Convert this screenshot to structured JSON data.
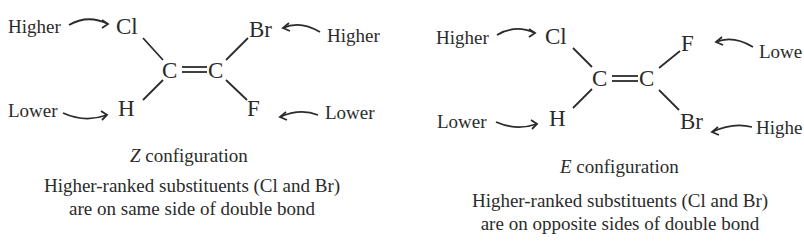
{
  "z_panel": {
    "labels": {
      "cl_rank": "Higher",
      "h_rank": "Lower",
      "br_rank": "Higher",
      "f_rank": "Lower"
    },
    "atoms": {
      "top_left": "Cl",
      "bottom_left": "H",
      "top_right": "Br",
      "bottom_right": "F",
      "carbon_left": "C",
      "carbon_right": "C"
    },
    "caption_italic": "Z",
    "caption_rest": " configuration",
    "description_line1": "Higher-ranked substituents (Cl and Br)",
    "description_line2": "are on same side of double bond"
  },
  "e_panel": {
    "labels": {
      "cl_rank": "Higher",
      "h_rank": "Lower",
      "f_rank": "Lowe",
      "br_rank": "Highe"
    },
    "atoms": {
      "top_left": "Cl",
      "bottom_left": "H",
      "top_right": "F",
      "bottom_right": "Br",
      "carbon_left": "C",
      "carbon_right": "C"
    },
    "caption_italic": "E",
    "caption_rest": " configuration",
    "description_line1": "Higher-ranked substituents (Cl and Br)",
    "description_line2": "are on opposite sides of double bond"
  },
  "colors": {
    "ink": "#2b2b2b",
    "background": "#ffffff"
  }
}
